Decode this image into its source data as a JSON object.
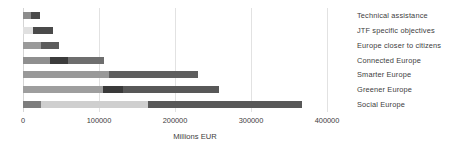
{
  "chart_data": {
    "type": "bar",
    "orientation": "horizontal",
    "stacked": true,
    "title": "",
    "xlabel": "Millions EUR",
    "ylabel": "",
    "xlim": [
      0,
      400000
    ],
    "xticks": [
      0,
      100000,
      200000,
      300000,
      400000
    ],
    "xtick_labels": [
      "0",
      "100000",
      "200000",
      "300000",
      "400000"
    ],
    "grid": true,
    "grid_axis": "x",
    "legend": "none",
    "categories": [
      "Social Europe",
      "Greener Europe",
      "Smarter Europe",
      "Connected Europe",
      "Europe closer to citizens",
      "JTF specific objectives",
      "Technical assistance"
    ],
    "category_order_top_to_bottom": [
      "Technical assistance",
      "JTF specific objectives",
      "Europe closer to citizens",
      "Connected Europe",
      "Smarter Europe",
      "Greener Europe",
      "Social Europe"
    ],
    "series": [
      {
        "name": "Segment 1",
        "color": "#808080",
        "values": [
          24000,
          13000,
          24000,
          35000,
          113000,
          105000,
          10000
        ]
      },
      {
        "name": "Segment 2",
        "color": "#c8c8c8",
        "values": [
          140000,
          138000,
          0,
          0,
          0,
          0,
          0
        ]
      },
      {
        "name": "Segment 3",
        "color": "#4a4a4a",
        "values": [
          203000,
          106000,
          117000,
          72000,
          0,
          27000,
          12000
        ]
      }
    ],
    "bar_segments": [
      {
        "category": "Technical assistance",
        "total": 22000,
        "segments": [
          {
            "value": 10000,
            "color": "#8c8c8c"
          },
          {
            "value": 12000,
            "color": "#4a4a4a"
          }
        ]
      },
      {
        "category": "JTF specific objectives",
        "total": 40000,
        "segments": [
          {
            "value": 13000,
            "color": "#e0e0e0"
          },
          {
            "value": 27000,
            "color": "#4a4a4a"
          }
        ]
      },
      {
        "category": "Europe closer to citizens",
        "total": 48000,
        "segments": [
          {
            "value": 24000,
            "color": "#9a9a9a"
          },
          {
            "value": 24000,
            "color": "#5c5c5c"
          }
        ]
      },
      {
        "category": "Connected Europe",
        "total": 107000,
        "segments": [
          {
            "value": 35000,
            "color": "#8f8f8f"
          },
          {
            "value": 24000,
            "color": "#3c3c3c"
          },
          {
            "value": 48000,
            "color": "#6e6e6e"
          }
        ]
      },
      {
        "category": "Smarter Europe",
        "total": 230000,
        "segments": [
          {
            "value": 113000,
            "color": "#999999"
          },
          {
            "value": 117000,
            "color": "#5e5e5e"
          }
        ]
      },
      {
        "category": "Greener Europe",
        "total": 258000,
        "segments": [
          {
            "value": 105000,
            "color": "#9e9e9e"
          },
          {
            "value": 26000,
            "color": "#3a3a3a"
          },
          {
            "value": 127000,
            "color": "#585858"
          }
        ]
      },
      {
        "category": "Social Europe",
        "total": 367000,
        "segments": [
          {
            "value": 24000,
            "color": "#7d7d7d"
          },
          {
            "value": 140000,
            "color": "#cfcfcf"
          },
          {
            "value": 203000,
            "color": "#585858"
          }
        ]
      }
    ]
  },
  "axis": {
    "x_title": "Millions EUR",
    "ticks": [
      "0",
      "100000",
      "200000",
      "300000",
      "400000"
    ]
  },
  "labels": {
    "items": [
      "Technical assistance",
      "JTF specific objectives",
      "Europe closer to citizens",
      "Connected Europe",
      "Smarter Europe",
      "Greener Europe",
      "Social Europe"
    ]
  }
}
